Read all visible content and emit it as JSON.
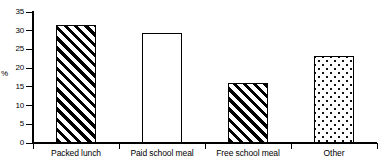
{
  "chart_data": {
    "type": "bar",
    "title": "",
    "subtitle": "",
    "xlabel": "",
    "ylabel": "%",
    "categories": [
      "Packed lunch",
      "Paid school meal",
      "Free school meal",
      "Other"
    ],
    "values": [
      31.5,
      29.3,
      16.1,
      23.3
    ],
    "series": [
      {
        "name": "",
        "values": [
          31.5,
          29.3,
          16.1,
          23.3
        ]
      }
    ],
    "ylim": [
      0,
      35
    ],
    "yticks": [
      0,
      5,
      10,
      15,
      20,
      25,
      30,
      35
    ],
    "ytick_labels": [
      "0",
      "5",
      "10",
      "15",
      "20",
      "25",
      "30",
      "35"
    ],
    "grid": false,
    "legend": false,
    "legend_position": "none",
    "bar_fills": [
      "diagonal-hatch",
      "open-white",
      "diagonal-hatch",
      "dotted"
    ],
    "colors": {
      "ink": "#000000",
      "background": "#ffffff"
    },
    "annotations": []
  }
}
